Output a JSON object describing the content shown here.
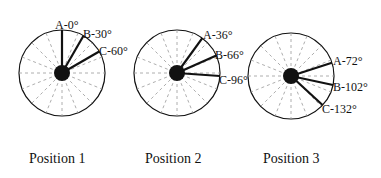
{
  "diagrams": [
    {
      "caption": "Position 1",
      "labels": {
        "a": "A-0°",
        "b": "B-30°",
        "c": "C-60°"
      },
      "angles": [
        0,
        30,
        60
      ]
    },
    {
      "caption": "Position 2",
      "labels": {
        "a": "A-36°",
        "b": "B-66°",
        "c": "C-96°"
      },
      "angles": [
        36,
        66,
        96
      ]
    },
    {
      "caption": "Position 3",
      "labels": {
        "a": "A-72°",
        "b": "B-102°",
        "c": "C-132°"
      },
      "angles": [
        72,
        102,
        132
      ]
    }
  ]
}
